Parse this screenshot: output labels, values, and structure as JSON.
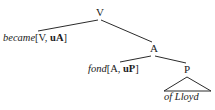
{
  "figure": {
    "kind": "syntax-tree",
    "background_color": "#ffffff",
    "line_color": "#2b2b2b",
    "text_color": "#1a1a1a"
  },
  "nodes": {
    "root": {
      "label": "V"
    },
    "adjective_phrase": {
      "label": "A"
    },
    "preposition_phrase": {
      "label": "P"
    }
  },
  "leaves": {
    "became": {
      "word": "became",
      "bracket_open": "[",
      "category": "V",
      "separator": ", ",
      "u_marker": "u",
      "selected_category": "A",
      "bracket_close": "]",
      "full_text": "became [V, uA]"
    },
    "fond": {
      "word": "fond",
      "bracket_open": "[",
      "category": "A",
      "separator": ", ",
      "u_marker": "u",
      "selected_category": "P",
      "bracket_close": "]",
      "full_text": "fond [A, uP]"
    },
    "of_lloyd": {
      "word": "of Lloyd",
      "full_text": "of Lloyd"
    }
  },
  "edges": [
    {
      "from": "V",
      "to": "became",
      "type": "line"
    },
    {
      "from": "V",
      "to": "A",
      "type": "line"
    },
    {
      "from": "A",
      "to": "fond",
      "type": "line"
    },
    {
      "from": "A",
      "to": "P",
      "type": "line"
    },
    {
      "from": "P",
      "to": "of Lloyd",
      "type": "triangle"
    }
  ]
}
